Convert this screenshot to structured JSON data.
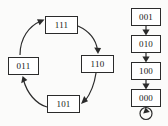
{
  "diagram": {
    "background_color": "#fbfbfa",
    "stroke_color": "#2b2b2b",
    "node_fill_color": "#ffffff",
    "cycle_group": {
      "name": "cycle-component",
      "nodes": [
        {
          "id": "n111",
          "label": "111",
          "x": 45,
          "y": 16,
          "w": 33,
          "h": 18
        },
        {
          "id": "n110",
          "label": "110",
          "x": 81,
          "y": 55,
          "w": 33,
          "h": 18
        },
        {
          "id": "n101",
          "label": "101",
          "x": 47,
          "y": 95,
          "w": 33,
          "h": 18
        },
        {
          "id": "n011",
          "label": "011",
          "x": 8,
          "y": 57,
          "w": 31,
          "h": 18
        }
      ],
      "edges": [
        {
          "from": "011",
          "to": "111",
          "kind": "curved"
        },
        {
          "from": "111",
          "to": "110",
          "kind": "curved"
        },
        {
          "from": "110",
          "to": "101",
          "kind": "curved"
        },
        {
          "from": "101",
          "to": "011",
          "kind": "curved"
        }
      ]
    },
    "chain_group": {
      "name": "chain-component",
      "nodes": [
        {
          "id": "n001",
          "label": "001",
          "x": 131,
          "y": 8,
          "w": 30,
          "h": 18
        },
        {
          "id": "n010",
          "label": "010",
          "x": 131,
          "y": 35,
          "w": 30,
          "h": 18
        },
        {
          "id": "n100",
          "label": "100",
          "x": 131,
          "y": 62,
          "w": 30,
          "h": 18
        },
        {
          "id": "n000",
          "label": "000",
          "x": 131,
          "y": 89,
          "w": 30,
          "h": 18
        }
      ],
      "edges": [
        {
          "from": "001",
          "to": "010",
          "kind": "straight"
        },
        {
          "from": "010",
          "to": "100",
          "kind": "straight"
        },
        {
          "from": "100",
          "to": "000",
          "kind": "straight"
        },
        {
          "from": "000",
          "to": "000",
          "kind": "self-loop"
        }
      ]
    }
  }
}
